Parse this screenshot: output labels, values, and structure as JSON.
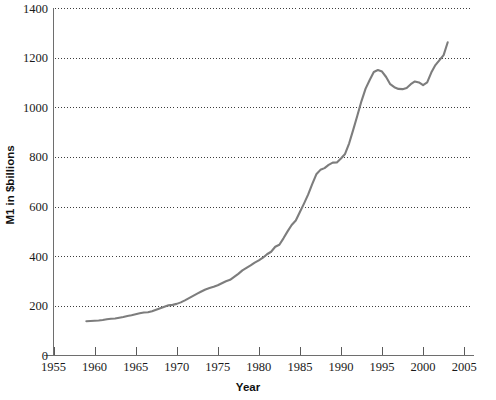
{
  "chart_data": {
    "type": "line",
    "title": "",
    "xlabel": "Year",
    "ylabel": "M1 in $billions",
    "xlim": [
      1955,
      2006.2
    ],
    "ylim": [
      0,
      1400
    ],
    "grid": true,
    "legend": false,
    "legend_position": "none",
    "line_color": "#7d7d7d",
    "xticks": [
      1955,
      1960,
      1965,
      1970,
      1975,
      1980,
      1985,
      1990,
      1995,
      2000,
      2005
    ],
    "xtick_labels": [
      "1955",
      "1960",
      "1965",
      "1970",
      "1975",
      "1980",
      "1985",
      "1990",
      "1995",
      "2000",
      "2005"
    ],
    "yticks": [
      0,
      200,
      400,
      600,
      800,
      1000,
      1200,
      1400
    ],
    "ytick_labels": [
      "0",
      "200",
      "400",
      "600",
      "800",
      "1000",
      "1200",
      "1400"
    ],
    "gridline_values": [
      200,
      400,
      600,
      800,
      1000,
      1200,
      1400
    ],
    "series": [
      {
        "name": "M1 money supply",
        "x": [
          1959.0,
          1959.5,
          1960.0,
          1960.5,
          1961.0,
          1961.5,
          1962.0,
          1962.5,
          1963.0,
          1963.5,
          1964.0,
          1964.5,
          1965.0,
          1965.5,
          1966.0,
          1966.5,
          1967.0,
          1967.5,
          1968.0,
          1968.5,
          1969.0,
          1969.5,
          1970.0,
          1970.5,
          1971.0,
          1971.5,
          1972.0,
          1972.5,
          1973.0,
          1973.5,
          1974.0,
          1974.5,
          1975.0,
          1975.5,
          1976.0,
          1976.5,
          1977.0,
          1977.5,
          1978.0,
          1978.5,
          1979.0,
          1979.5,
          1980.0,
          1980.5,
          1981.0,
          1981.5,
          1982.0,
          1982.5,
          1983.0,
          1983.5,
          1984.0,
          1984.5,
          1985.0,
          1985.5,
          1986.0,
          1986.5,
          1987.0,
          1987.5,
          1988.0,
          1988.5,
          1989.0,
          1989.5,
          1990.0,
          1990.5,
          1991.0,
          1991.5,
          1992.0,
          1992.5,
          1993.0,
          1993.5,
          1994.0,
          1994.5,
          1995.0,
          1995.5,
          1996.0,
          1996.5,
          1997.0,
          1997.5,
          1998.0,
          1998.5,
          1999.0,
          1999.5,
          2000.0,
          2000.5,
          2001.0,
          2001.5,
          2002.0,
          2002.5,
          2003.0
        ],
        "values": [
          138,
          139,
          140,
          141,
          143,
          146,
          148,
          149,
          152,
          155,
          159,
          162,
          166,
          170,
          173,
          174,
          178,
          184,
          190,
          196,
          202,
          204,
          208,
          214,
          222,
          231,
          240,
          249,
          258,
          266,
          272,
          277,
          283,
          291,
          299,
          305,
          317,
          329,
          343,
          353,
          363,
          374,
          383,
          394,
          408,
          418,
          438,
          446,
          472,
          500,
          526,
          544,
          578,
          612,
          648,
          690,
          730,
          748,
          755,
          768,
          777,
          778,
          794,
          812,
          855,
          910,
          967,
          1025,
          1075,
          1110,
          1142,
          1150,
          1144,
          1122,
          1093,
          1081,
          1074,
          1073,
          1078,
          1093,
          1104,
          1100,
          1089,
          1100,
          1140,
          1170,
          1190,
          1210,
          1262
        ]
      }
    ]
  },
  "axis": {
    "x_title": "Year",
    "y_title": "M1 in $billions"
  }
}
